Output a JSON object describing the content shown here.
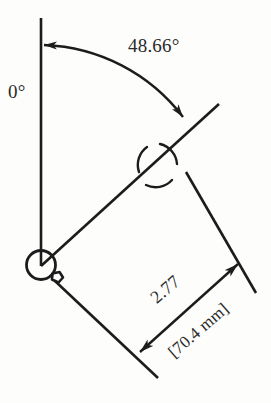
{
  "drawing": {
    "title": "Angular and linear dimension annotation",
    "background_color": "#fdfdfc",
    "line_color": "#1c1c1c",
    "text_color": "#2a2a2a",
    "datum": {
      "label": "0°",
      "name": "zero-degree-datum",
      "description": "vertical reference line"
    },
    "angle_dimension": {
      "label": "48.66°",
      "value": 48.66,
      "unit": "degrees",
      "arrow_style": "double-ended-arc"
    },
    "linear_dimension": {
      "primary_label": "2.77",
      "primary_value": 2.77,
      "primary_unit": "in",
      "alternate_label": "[70.4 mm]",
      "alternate_value": 70.4,
      "alternate_unit": "mm",
      "arrow_style": "double-ended-linear"
    },
    "pivot": {
      "name": "pivot-hinge-symbol",
      "description": "circle with notch marking rotation origin"
    },
    "markers": [
      {
        "name": "perpendicular-intersection-marker",
        "description": "broken circle arcs at line intersection"
      }
    ]
  }
}
